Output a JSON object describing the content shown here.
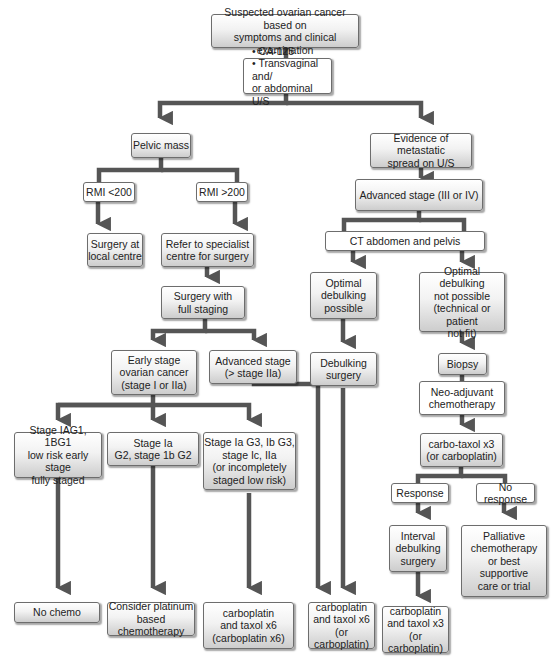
{
  "flowchart": {
    "title": "Suspected ovarian cancer management pathway",
    "nodes": {
      "start": "Suspected ovarian cancer based on\nsymptoms and clinical examination",
      "tests": "• CA-125\n• Transvaginal and/\n   or abdominal U/S",
      "pelvic_mass": "Pelvic mass",
      "metastatic": "Evidence of metastatic\nspread on U/S",
      "rmi_low": "RMI <200",
      "rmi_high": "RMI >200",
      "surgery_local": "Surgery at\nlocal centre",
      "refer_specialist": "Refer to specialist\ncentre for surgery",
      "surgery_staging": "Surgery with\nfull staging",
      "early_stage": "Early stage\novarian cancer\n(stage I or IIa)",
      "advanced_stage_iia": "Advanced stage\n(> stage IIa)",
      "advanced_stage_iii_iv": "Advanced stage (III or IV)",
      "ct": "CT abdomen and pelvis",
      "optimal_possible": "Optimal\ndebulking\npossible",
      "optimal_not_possible": "Optimal debulking\nnot possible\n(technical or patient\nnot fit)",
      "debulking_surgery": "Debulking\nsurgery",
      "biopsy": "Biopsy",
      "neoadjuvant": "Neo-adjuvant\nchemotherapy",
      "carbo_taxol_x3": "carbo-taxol x3\n(or carboplatin)",
      "response": "Response",
      "no_response": "No response",
      "interval_debulking": "Interval\ndebulking\nsurgery",
      "palliative": "Palliative\nchemotherapy\nor best\nsupportive\ncare or trial",
      "stage_low_risk": "Stage IAG1, 1BG1\nlow risk early stage\nfully staged",
      "stage_ia_g2": "Stage Ia\nG2, stage 1b G2",
      "stage_high_risk": "Stage Ia G3, Ib G3,\nstage Ic, IIa\n(or incompletely\nstaged low risk)",
      "no_chemo": "No chemo",
      "consider_platinum": "Consider platinum\nbased chemotherapy",
      "carbo_taxol_x6_a": "carboplatin\nand taxol x6\n(carboplatin x6)",
      "carbo_taxol_x6_b": "carboplatin\nand taxol x6\n(or carboplatin)",
      "carbo_taxol_x3_final": "carboplatin\nand taxol x3\n(or carboplatin)"
    },
    "colors": {
      "connector": "#555555",
      "border": "#6d6d6d",
      "box_gradient_top": "#ffffff",
      "box_gradient_bottom": "#cdcdcd"
    }
  }
}
